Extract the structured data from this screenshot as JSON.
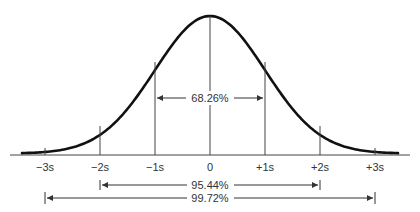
{
  "diagram": {
    "axis_labels": [
      "−3s",
      "−2s",
      "−1s",
      "0",
      "+1s",
      "+2s",
      "+3s"
    ],
    "intervals": [
      {
        "label": "68.26%",
        "from": "−1s",
        "to": "+1s"
      },
      {
        "label": "95.44%",
        "from": "−2s",
        "to": "+2s"
      },
      {
        "label": "99.72%",
        "from": "−3s",
        "to": "+3s"
      }
    ],
    "colors": {
      "curve": "#111111",
      "lines": "#444444"
    }
  }
}
